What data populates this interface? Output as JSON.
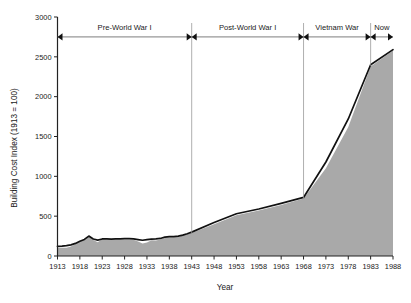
{
  "chart_data": {
    "type": "area",
    "title": "",
    "xlabel": "Year",
    "ylabel": "Building Cost Index (1913 = 100)",
    "xlim": [
      1913,
      1988
    ],
    "ylim": [
      0,
      3000
    ],
    "grid": false,
    "legend": "none",
    "y_ticks": [
      0,
      500,
      1000,
      1500,
      2000,
      2500,
      3000
    ],
    "x_ticks": [
      1913,
      1918,
      1923,
      1928,
      1933,
      1938,
      1943,
      1948,
      1953,
      1958,
      1963,
      1968,
      1973,
      1978,
      1983,
      1988
    ],
    "series": [
      {
        "name": "Building Cost Index (filled area)",
        "style": "area-gray-fill",
        "x": [
          1913,
          1914,
          1915,
          1916,
          1917,
          1918,
          1919,
          1920,
          1921,
          1922,
          1923,
          1924,
          1925,
          1926,
          1927,
          1928,
          1929,
          1930,
          1931,
          1932,
          1933,
          1934,
          1935,
          1936,
          1937,
          1938,
          1939,
          1940,
          1941,
          1942,
          1943,
          1948,
          1953,
          1958,
          1963,
          1968,
          1973,
          1978,
          1983,
          1988
        ],
        "values": [
          100,
          102,
          105,
          118,
          150,
          185,
          205,
          251,
          202,
          174,
          214,
          207,
          203,
          208,
          206,
          207,
          207,
          203,
          181,
          157,
          170,
          198,
          196,
          206,
          236,
          236,
          236,
          239,
          258,
          276,
          290,
          400,
          510,
          570,
          640,
          721,
          1100,
          1620,
          2380,
          2580
        ]
      },
      {
        "name": "Building Cost Index (line)",
        "style": "line-black",
        "x": [
          1913,
          1914,
          1915,
          1916,
          1917,
          1918,
          1919,
          1920,
          1921,
          1922,
          1923,
          1924,
          1925,
          1926,
          1927,
          1928,
          1929,
          1930,
          1931,
          1932,
          1933,
          1934,
          1935,
          1936,
          1937,
          1938,
          1939,
          1940,
          1941,
          1942,
          1943,
          1948,
          1953,
          1958,
          1963,
          1968,
          1973,
          1978,
          1983,
          1988
        ],
        "values": [
          120,
          124,
          130,
          140,
          158,
          186,
          208,
          250,
          214,
          200,
          214,
          215,
          213,
          216,
          216,
          218,
          218,
          214,
          206,
          198,
          205,
          212,
          214,
          220,
          238,
          242,
          244,
          250,
          262,
          280,
          300,
          420,
          530,
          590,
          660,
          735,
          1180,
          1720,
          2400,
          2590
        ]
      }
    ],
    "annotations": [
      {
        "label": "Pre-World War I",
        "from": 1913,
        "to": 1943,
        "y": 2750
      },
      {
        "label": "Post-World War I",
        "from": 1943,
        "to": 1968,
        "y": 2750
      },
      {
        "label": "Vietnam War",
        "from": 1968,
        "to": 1983,
        "y": 2750
      },
      {
        "label": "Now",
        "from": 1983,
        "to": 1988,
        "y": 2750
      }
    ],
    "dividers": [
      1943,
      1968,
      1983
    ],
    "colors": {
      "area_fill": "#a9a9a9",
      "line": "#111111",
      "axis": "#222222",
      "divider": "#9a9a9a",
      "annotation_rule": "#6e6e6e",
      "background": "#ffffff"
    }
  },
  "axes": {
    "y_title": "Building Cost Index (1913 = 100)",
    "x_title": "Year"
  }
}
